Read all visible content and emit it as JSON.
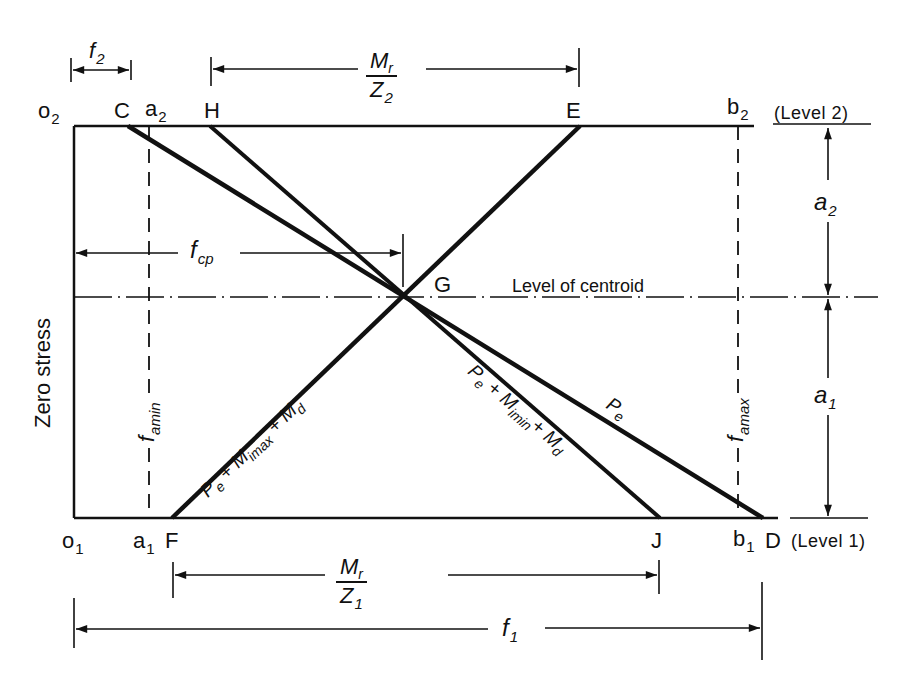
{
  "figure": {
    "type": "stress-distribution-diagram",
    "points": {
      "o2": "o",
      "o2_sub": "2",
      "C": "C",
      "a2": "a",
      "a2_sub": "2",
      "H": "H",
      "E": "E",
      "b2": "b",
      "b2_sub": "2",
      "o1": "o",
      "o1_sub": "1",
      "a1": "a",
      "a1_sub": "1",
      "F": "F",
      "J": "J",
      "b1": "b",
      "b1_sub": "1",
      "D": "D",
      "G": "G"
    },
    "levels": {
      "level2": "(Level 2)",
      "level1": "(Level 1)",
      "centroid": "Level of centroid",
      "zero_stress": "Zero stress"
    },
    "dimensions": {
      "f2": {
        "symbol": "f",
        "sub": "2"
      },
      "mr_z2": {
        "num": "M",
        "num_sub": "r",
        "den": "Z",
        "den_sub": "2"
      },
      "mr_z1": {
        "num": "M",
        "num_sub": "r",
        "den": "Z",
        "den_sub": "1"
      },
      "fcp": {
        "symbol": "f",
        "sub": "cp"
      },
      "f1": {
        "symbol": "f",
        "sub": "1"
      },
      "a2": {
        "symbol": "a",
        "sub": "2"
      },
      "a1": {
        "symbol": "a",
        "sub": "1"
      },
      "famin": {
        "symbol": "f",
        "sub": "amin"
      },
      "famax": {
        "symbol": "f",
        "sub": "amax"
      }
    },
    "line_labels": {
      "pe": {
        "p": "P",
        "p_sub": "e"
      },
      "pe_max": {
        "p": "P",
        "p_sub": "e",
        "rest": " + M",
        "m_sub": "imax",
        "rest2": " + M",
        "d_sub": "d"
      },
      "pe_min": {
        "p": "P",
        "p_sub": "e",
        "rest": " + M",
        "m_sub": "imin",
        "rest2": "+ M",
        "d_sub": "d"
      }
    },
    "colors": {
      "ink": "#111111",
      "background": "#ffffff"
    }
  }
}
